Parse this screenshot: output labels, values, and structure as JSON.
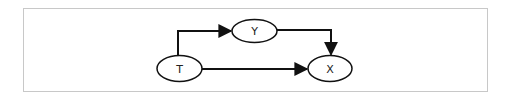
{
  "diagram": {
    "type": "causal-graph",
    "colors": {
      "frame_border": "#c8c8c8",
      "stroke": "#111111",
      "node_fill": "#ffffff",
      "text": "#222222"
    },
    "nodes": [
      {
        "id": "T",
        "label": "T",
        "cx": 179.5,
        "cy": 68.5,
        "rx": 22.5,
        "ry": 13
      },
      {
        "id": "Y",
        "label": "Y",
        "cx": 254.5,
        "cy": 31,
        "rx": 22.5,
        "ry": 11.5
      },
      {
        "id": "X",
        "label": "X",
        "cx": 330,
        "cy": 68.5,
        "rx": 22,
        "ry": 13
      }
    ],
    "edges": [
      {
        "from": "T",
        "to": "Y",
        "label": ""
      },
      {
        "from": "Y",
        "to": "X",
        "label": ""
      },
      {
        "from": "T",
        "to": "X",
        "label": ""
      }
    ]
  }
}
